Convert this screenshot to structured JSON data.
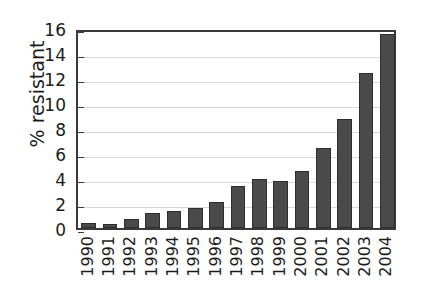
{
  "chart_data": {
    "type": "bar",
    "title": "",
    "subtitle": "",
    "xlabel": "",
    "ylabel": "% resistant",
    "categories": [
      "1990",
      "1991",
      "1992",
      "1993",
      "1994",
      "1995",
      "1996",
      "1997",
      "1998",
      "1999",
      "2000",
      "2001",
      "2002",
      "2003",
      "2004"
    ],
    "values": [
      0.4,
      0.3,
      0.7,
      1.2,
      1.4,
      1.6,
      2.1,
      3.4,
      3.9,
      3.8,
      4.6,
      6.4,
      8.7,
      12.4,
      15.5
    ],
    "ylim": [
      0,
      16
    ],
    "yticks": [
      0,
      2,
      4,
      6,
      8,
      10,
      12,
      14,
      16
    ],
    "ytick_labels": [
      "0",
      "2",
      "4",
      "6",
      "8",
      "10",
      "12",
      "14",
      "16"
    ],
    "grid": true,
    "grid_axis": "y",
    "legend": false,
    "legend_position": "none",
    "bar_color": "#4a4a4a",
    "bar_edge_color": "#2e2e2e",
    "grid_color": "#d8d8d8",
    "axis_color": "#3a3a3a",
    "background_color": "#ffffff",
    "text_color": "#1c1c1c"
  }
}
